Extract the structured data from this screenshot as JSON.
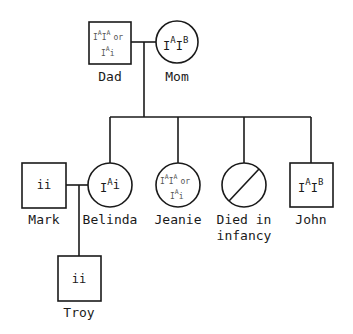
{
  "colors": {
    "ink": "#1a1a1a",
    "faint_ink": "#555555",
    "background": "#ffffff"
  },
  "generations": {
    "parents": {
      "dad": {
        "name": "Dad",
        "sex": "male",
        "genotype_line1": "I^A I^A  or",
        "genotype_line2": "I^A i"
      },
      "mom": {
        "name": "Mom",
        "sex": "female",
        "genotype": "I^A I^B"
      }
    },
    "children": [
      {
        "name": "Belinda",
        "sex": "female",
        "genotype": "I^A i"
      },
      {
        "name": "Jeanie",
        "sex": "female",
        "genotype_line1": "I^A I^A  or",
        "genotype_line2": "I^A i"
      },
      {
        "name_line1": "Died in",
        "name_line2": "infancy",
        "sex": "female",
        "status": "deceased"
      },
      {
        "name": "John",
        "sex": "male",
        "genotype": "I^A I^B"
      }
    ],
    "spouse": {
      "name": "Mark",
      "sex": "male",
      "genotype": "ii"
    },
    "grandchild": {
      "name": "Troy",
      "sex": "male",
      "genotype": "ii"
    }
  },
  "text": {
    "dad_name": "Dad",
    "mom_name": "Mom",
    "mark_name": "Mark",
    "belinda_name": "Belinda",
    "jeanie_name": "Jeanie",
    "died_line1": "Died in",
    "died_line2": "infancy",
    "john_name": "John",
    "troy_name": "Troy",
    "or": "or",
    "I": "I",
    "A": "A",
    "B": "B",
    "i": "i",
    "ii": "ii"
  }
}
